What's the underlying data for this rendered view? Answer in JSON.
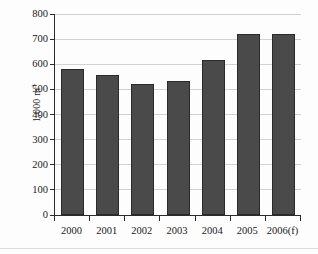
{
  "chart_data": {
    "type": "bar",
    "title": "",
    "xlabel": "",
    "ylabel": "1,000 m",
    "ylabel_sup": "3",
    "categories": [
      "2000",
      "2001",
      "2002",
      "2003",
      "2004",
      "2005",
      "2006(f)"
    ],
    "values": [
      583,
      558,
      523,
      532,
      618,
      722,
      720
    ],
    "series": [
      {
        "name": "Volume",
        "values": [
          583,
          558,
          523,
          532,
          618,
          722,
          720
        ]
      }
    ],
    "ylim": [
      0,
      800
    ],
    "yticks": [
      0,
      100,
      200,
      300,
      400,
      500,
      600,
      700,
      800
    ],
    "ytick_labels": [
      "0",
      "100",
      "200",
      "300",
      "400",
      "500",
      "600",
      "700",
      "800"
    ],
    "grid": true,
    "legend": "none",
    "bar_color": "#4a4a4a",
    "bar_border_color": "#2a2a2a",
    "grid_color": "#d2d2d2",
    "axis_color": "#2b2b2b",
    "background_color": "#fdfdfd"
  }
}
